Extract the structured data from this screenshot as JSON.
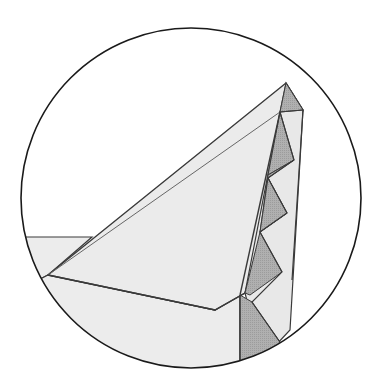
{
  "diagram": {
    "type": "origami-fold-detail",
    "view": "circular-magnified-inset",
    "caption_fragment": "",
    "colors": {
      "background": "#ffffff",
      "circle_stroke": "#1a1a1a",
      "paper_light": "#ececec",
      "paper_mid": "#e4e4e4",
      "paper_shaded": "#a9a9a9",
      "fold_line": "#555555",
      "outline": "#3a3a3a"
    },
    "elements": [
      {
        "name": "magnify-circle",
        "desc": "circular detail frame"
      },
      {
        "name": "large-triangle-flap",
        "desc": "large pale triangular flap pointing upward-right"
      },
      {
        "name": "pleated-edge",
        "desc": "zig-zag pleats with shaded triangles along right edge"
      },
      {
        "name": "base-layer",
        "desc": "paper layer extending to the left and bottom"
      }
    ]
  }
}
